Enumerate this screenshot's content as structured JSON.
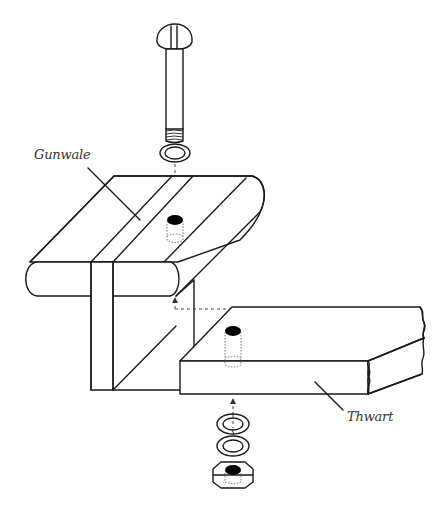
{
  "diagram": {
    "title": "",
    "labels": {
      "gunwale": "Gunwale",
      "thwart": "Thwart"
    },
    "parts": [
      {
        "id": "bolt",
        "name": "Slotted round-head bolt"
      },
      {
        "id": "top-washer",
        "name": "Flat washer"
      },
      {
        "id": "gunwale",
        "name": "Gunwale"
      },
      {
        "id": "thwart",
        "name": "Thwart"
      },
      {
        "id": "lock-washer",
        "name": "Lock washer"
      },
      {
        "id": "bottom-washer",
        "name": "Flat washer"
      },
      {
        "id": "nut",
        "name": "Hex nut"
      }
    ],
    "colors": {
      "line": "#1a1a1a",
      "background": "#ffffff",
      "hole": "#000000"
    }
  }
}
